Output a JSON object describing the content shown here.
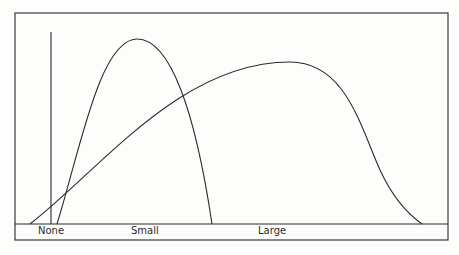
{
  "diagram": {
    "title": "",
    "categories": [
      {
        "key": "none",
        "label": "None",
        "label_x": 38
      },
      {
        "key": "small",
        "label": "Small",
        "label_x": 131
      },
      {
        "key": "large",
        "label": "Large",
        "label_x": 258
      }
    ],
    "curves": [
      {
        "name": "small-effect-curve",
        "description": "narrow tall bell curve",
        "start": [
          57,
          224
        ],
        "peak": [
          137,
          39
        ],
        "end": [
          212,
          224
        ]
      },
      {
        "name": "large-effect-curve",
        "description": "wide skewed bell curve",
        "start": [
          30,
          224
        ],
        "peak": [
          290,
          62
        ],
        "end": [
          422,
          224
        ]
      }
    ],
    "none_marker": {
      "x": 51,
      "top": 32,
      "bottom": 224
    },
    "frame": {
      "left": 15,
      "top": 13,
      "right": 448,
      "bottom": 240
    },
    "baseline_y": 224,
    "colors": {
      "stroke": "#2b2b2b",
      "frame": "#3a3a3a",
      "background": "#fdfdfc"
    }
  }
}
